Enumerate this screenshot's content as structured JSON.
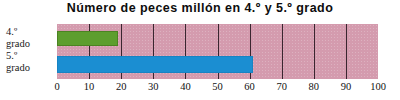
{
  "chart_data": {
    "type": "bar",
    "orientation": "horizontal",
    "title": "Número de peces millón en 4.º y 5.º grado",
    "xlabel": "",
    "ylabel": "",
    "categories": [
      "4.º grado",
      "5.º grado"
    ],
    "category_lines": [
      [
        "4.º",
        "grado"
      ],
      [
        "5.º",
        "grado"
      ]
    ],
    "values": [
      19,
      61
    ],
    "xlim": [
      0,
      100
    ],
    "xticks": [
      0,
      10,
      20,
      30,
      40,
      50,
      60,
      70,
      80,
      90,
      100
    ],
    "xtick_labels": [
      "0",
      "10",
      "20",
      "30",
      "40",
      "50",
      "60",
      "70",
      "80",
      "90",
      "100"
    ],
    "grid": true,
    "grid_axis": "x",
    "legend": "none",
    "bar_colors": [
      "#5d9e2e",
      "#1b8ed2"
    ],
    "plot_background": "#d49bae",
    "gridline_color": "#3a2630",
    "title_color": "#0d0d0d"
  }
}
